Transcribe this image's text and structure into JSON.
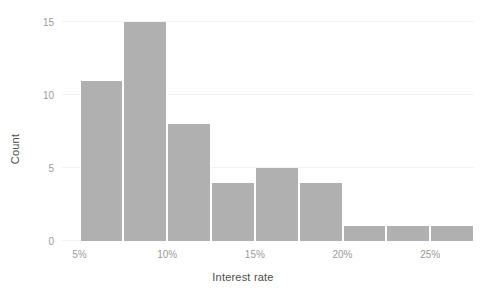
{
  "chart_data": {
    "type": "bar",
    "title": "",
    "subtitle": "",
    "xlabel": "Interest rate",
    "ylabel": "Count",
    "categories": [
      "5%-7.5%",
      "7.5%-10%",
      "10%-12.5%",
      "12.5%-15%",
      "15%-17.5%",
      "17.5%-20%",
      "20%-22.5%",
      "22.5%-25%",
      "25%-27.5%"
    ],
    "bin_starts": [
      5,
      7.5,
      10,
      12.5,
      15,
      17.5,
      20,
      22.5,
      25
    ],
    "bin_width": 2.5,
    "values": [
      11,
      15,
      8,
      4,
      5,
      4,
      1,
      1,
      1
    ],
    "xlim": [
      4.0,
      27.5
    ],
    "ylim": [
      0,
      15.5
    ],
    "y_ticks": [
      0,
      5,
      10,
      15
    ],
    "y_tick_labels": [
      "0",
      "5",
      "10",
      "15"
    ],
    "x_ticks": [
      5,
      10,
      15,
      20,
      25
    ],
    "x_tick_labels": [
      "5%",
      "10%",
      "15%",
      "20%",
      "25%"
    ],
    "grid": "horizontal-faint",
    "legend": "none",
    "bar_color": "#b0b0b0",
    "bar_edge_color": "#ffffff",
    "background_color": "#ffffff",
    "tick_label_color": "#9a9a9a",
    "axis_title_color": "#4d4d4d"
  }
}
